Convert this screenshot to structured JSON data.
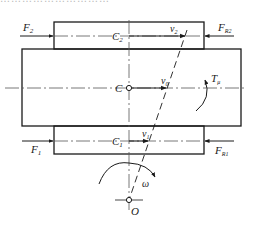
{
  "figure": {
    "cropped_caption_fragment": "…………………………",
    "labels": {
      "F2": {
        "main": "F",
        "sub": "2"
      },
      "FR2": {
        "main": "F",
        "sub": "R2"
      },
      "F1": {
        "main": "F",
        "sub": "1"
      },
      "FR1": {
        "main": "F",
        "sub": "R1"
      },
      "C": "C",
      "C2": {
        "main": "C",
        "sub": "2"
      },
      "C1": {
        "main": "C",
        "sub": "1"
      },
      "v0": {
        "main": "v",
        "sub": "0"
      },
      "v1": {
        "main": "v",
        "sub": "1"
      },
      "v2": {
        "main": "v",
        "sub": "2"
      },
      "T_mu": {
        "main": "T",
        "sub": "μ"
      },
      "omega": "ω",
      "O": "O"
    },
    "colors": {
      "stroke": "#1a1a1a",
      "centerline": "#555555",
      "background": "#ffffff"
    },
    "geometry": {
      "upper_block": {
        "x": 54,
        "y": 22,
        "w": 150,
        "h": 27
      },
      "main_body": {
        "x": 22,
        "y": 49,
        "w": 219,
        "h": 77
      },
      "lower_block": {
        "x": 54,
        "y": 126,
        "w": 150,
        "h": 28
      },
      "C_point": [
        129,
        88
      ],
      "O_point": [
        129,
        200
      ]
    }
  }
}
